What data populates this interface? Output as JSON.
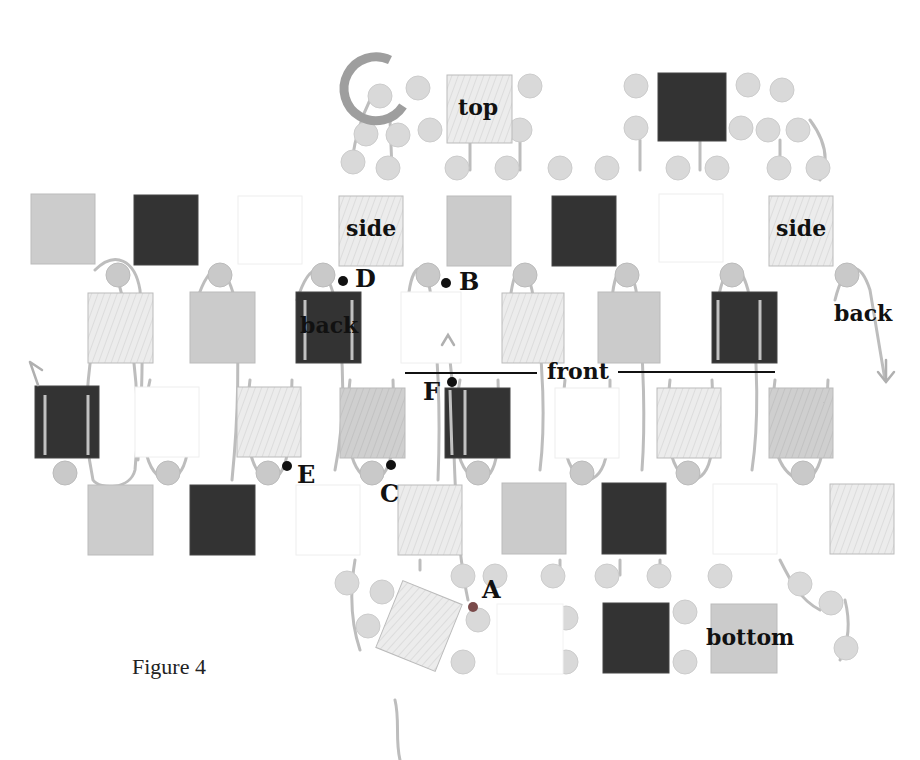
{
  "figure": {
    "caption": "Figure 4",
    "colors": {
      "dark": "#333333",
      "medium": "#c4c4c4",
      "light": "#e4e4e4",
      "white": "#ffffff",
      "bead": "#d8d8d8",
      "bead_edge": "#c8c8c8",
      "thread": "#b8b8b8",
      "marker": "#111111",
      "start_bead": "#7a4a4a",
      "ring": "#9a9a9a"
    },
    "face_labels": {
      "top": "top",
      "side_left": "side",
      "side_right": "side",
      "back_left": "back",
      "back_right": "back",
      "front": "front",
      "bottom": "bottom"
    },
    "point_labels": {
      "A": "A",
      "B": "B",
      "C": "C",
      "D": "D",
      "E": "E",
      "F": "F"
    }
  }
}
